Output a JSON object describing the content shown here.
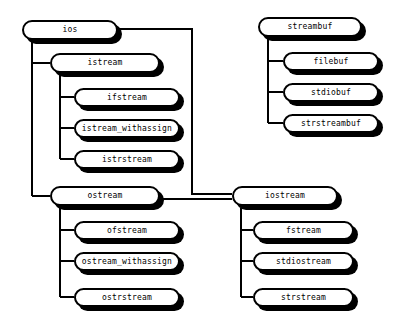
{
  "diagram": {
    "type": "class-hierarchy",
    "background_color": "#ffffff",
    "line_color": "#000000",
    "node_fill_color": "#ffffff",
    "node_border_color": "#000000",
    "node_shadow_color": "#000000",
    "nodes": [
      {
        "id": "ios",
        "label": "ios",
        "x": 22,
        "y": 20,
        "w": 96,
        "h": 20
      },
      {
        "id": "istream",
        "label": "istream",
        "x": 50,
        "y": 53,
        "w": 110,
        "h": 20
      },
      {
        "id": "ifstream",
        "label": "ifstream",
        "x": 74,
        "y": 88,
        "w": 106,
        "h": 19
      },
      {
        "id": "istream_withassign",
        "label": "istream_withassign",
        "x": 74,
        "y": 119,
        "w": 106,
        "h": 19
      },
      {
        "id": "istrstream",
        "label": "istrstream",
        "x": 74,
        "y": 150,
        "w": 106,
        "h": 19
      },
      {
        "id": "ostream",
        "label": "ostream",
        "x": 50,
        "y": 186,
        "w": 110,
        "h": 20
      },
      {
        "id": "ofstream",
        "label": "ofstream",
        "x": 74,
        "y": 221,
        "w": 106,
        "h": 19
      },
      {
        "id": "ostream_withassign",
        "label": "ostream_withassign",
        "x": 74,
        "y": 252,
        "w": 106,
        "h": 19
      },
      {
        "id": "ostrstream",
        "label": "ostrstream",
        "x": 74,
        "y": 288,
        "w": 106,
        "h": 19
      },
      {
        "id": "iostream",
        "label": "iostream",
        "x": 232,
        "y": 186,
        "w": 106,
        "h": 20
      },
      {
        "id": "fstream",
        "label": "fstream",
        "x": 253,
        "y": 221,
        "w": 101,
        "h": 19
      },
      {
        "id": "stdiostream",
        "label": "stdiostream",
        "x": 253,
        "y": 252,
        "w": 101,
        "h": 19
      },
      {
        "id": "strstream",
        "label": "strstream",
        "x": 253,
        "y": 288,
        "w": 101,
        "h": 19
      },
      {
        "id": "streambuf",
        "label": "streambuf",
        "x": 258,
        "y": 17,
        "w": 104,
        "h": 20
      },
      {
        "id": "filebuf",
        "label": "filebuf",
        "x": 283,
        "y": 52,
        "w": 96,
        "h": 19
      },
      {
        "id": "stdiobuf",
        "label": "stdiobuf",
        "x": 283,
        "y": 83,
        "w": 96,
        "h": 19
      },
      {
        "id": "strstreambuf",
        "label": "strstreambuf",
        "x": 283,
        "y": 114,
        "w": 96,
        "h": 19
      }
    ],
    "edges": [
      {
        "from": "ios",
        "to": "istream"
      },
      {
        "from": "ios",
        "to": "ostream"
      },
      {
        "from": "ios",
        "to": "iostream"
      },
      {
        "from": "istream",
        "to": "ifstream"
      },
      {
        "from": "istream",
        "to": "istream_withassign"
      },
      {
        "from": "istream",
        "to": "istrstream"
      },
      {
        "from": "ostream",
        "to": "ofstream"
      },
      {
        "from": "ostream",
        "to": "ostream_withassign"
      },
      {
        "from": "ostream",
        "to": "ostrstream"
      },
      {
        "from": "ostream",
        "to": "iostream"
      },
      {
        "from": "iostream",
        "to": "fstream"
      },
      {
        "from": "iostream",
        "to": "stdiostream"
      },
      {
        "from": "iostream",
        "to": "strstream"
      },
      {
        "from": "streambuf",
        "to": "filebuf"
      },
      {
        "from": "streambuf",
        "to": "stdiobuf"
      },
      {
        "from": "streambuf",
        "to": "strstreambuf"
      }
    ]
  }
}
